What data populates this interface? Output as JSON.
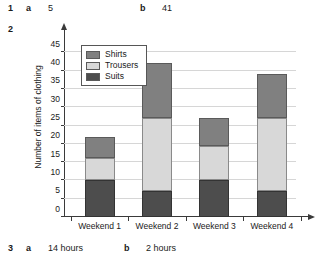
{
  "answers": [
    {
      "number": "1",
      "parts": [
        {
          "label": "a",
          "value": "5"
        },
        {
          "label": "b",
          "value": "41"
        }
      ]
    },
    {
      "number": "2",
      "parts": []
    },
    {
      "number": "3",
      "parts": [
        {
          "label": "a",
          "value": "14 hours"
        },
        {
          "label": "b",
          "value": "2 hours"
        }
      ]
    }
  ],
  "chart_data": {
    "type": "bar",
    "stacked": true,
    "title": "",
    "xlabel": "",
    "ylabel": "Number of items of clothing",
    "categories": [
      "Weekend 1",
      "Weekend 2",
      "Weekend 3",
      "Weekend 4"
    ],
    "series": [
      {
        "name": "Suits",
        "color": "#4d4d4d",
        "values": [
          10,
          7,
          10,
          7
        ]
      },
      {
        "name": "Trousers",
        "color": "#d8d8d8",
        "values": [
          6,
          20,
          9.5,
          20
        ]
      },
      {
        "name": "Shirts",
        "color": "#808080",
        "values": [
          6,
          15,
          7.5,
          12
        ]
      }
    ],
    "totals": [
      22,
      42,
      27,
      39
    ],
    "ylim": [
      0,
      47
    ],
    "yticks": [
      0,
      5,
      10,
      15,
      20,
      25,
      30,
      35,
      40,
      45
    ],
    "grid": true,
    "legend_position": "top-left",
    "legend_order": [
      "Shirts",
      "Trousers",
      "Suits"
    ]
  }
}
